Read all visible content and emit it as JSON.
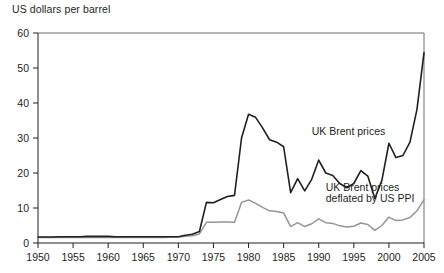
{
  "chart_data": {
    "type": "line",
    "title": "",
    "ylabel": "US dollars per barrel",
    "xlabel": "",
    "xlim": [
      1950,
      2005
    ],
    "ylim": [
      0,
      60
    ],
    "grid": false,
    "legend_position": "inline-annotation",
    "x_ticks": [
      1950,
      1955,
      1960,
      1965,
      1970,
      1975,
      1980,
      1985,
      1990,
      1995,
      2000,
      2005
    ],
    "y_ticks": [
      0,
      10,
      20,
      30,
      40,
      50,
      60
    ],
    "x": [
      1950,
      1951,
      1952,
      1953,
      1954,
      1955,
      1956,
      1957,
      1958,
      1959,
      1960,
      1961,
      1962,
      1963,
      1964,
      1965,
      1966,
      1967,
      1968,
      1969,
      1970,
      1971,
      1972,
      1973,
      1974,
      1975,
      1976,
      1977,
      1978,
      1979,
      1980,
      1981,
      1982,
      1983,
      1984,
      1985,
      1986,
      1987,
      1988,
      1989,
      1990,
      1991,
      1992,
      1993,
      1994,
      1995,
      1996,
      1997,
      1998,
      1999,
      2000,
      2001,
      2002,
      2003,
      2004,
      2005
    ],
    "series": [
      {
        "name": "UK Brent prices",
        "color": "#231f20",
        "values": [
          1.7,
          1.7,
          1.7,
          1.8,
          1.8,
          1.8,
          1.8,
          1.9,
          1.9,
          1.9,
          1.9,
          1.8,
          1.8,
          1.8,
          1.8,
          1.8,
          1.8,
          1.8,
          1.8,
          1.8,
          1.8,
          2.2,
          2.5,
          3.3,
          11.6,
          11.5,
          12.4,
          13.3,
          13.6,
          30.0,
          36.8,
          35.9,
          32.9,
          29.5,
          28.8,
          27.5,
          14.4,
          18.4,
          14.9,
          18.2,
          23.7,
          20.0,
          19.3,
          17.0,
          15.8,
          17.0,
          20.7,
          19.1,
          12.7,
          17.9,
          28.5,
          24.4,
          25.0,
          28.8,
          38.2,
          54.4
        ]
      },
      {
        "name": "UK Brent prices deflated by US PPI",
        "color": "#949599",
        "values": [
          1.6,
          1.6,
          1.6,
          1.6,
          1.6,
          1.6,
          1.6,
          1.6,
          1.6,
          1.6,
          1.6,
          1.6,
          1.6,
          1.6,
          1.6,
          1.6,
          1.6,
          1.6,
          1.6,
          1.7,
          1.7,
          1.9,
          2.1,
          2.6,
          5.9,
          5.9,
          6.0,
          6.0,
          5.9,
          11.6,
          12.3,
          11.3,
          10.2,
          9.2,
          9.0,
          8.6,
          4.7,
          5.8,
          4.7,
          5.5,
          6.9,
          5.8,
          5.6,
          4.9,
          4.6,
          4.8,
          5.7,
          5.3,
          3.6,
          5.0,
          7.4,
          6.4,
          6.6,
          7.3,
          9.2,
          12.4
        ]
      }
    ],
    "annotations": [
      {
        "text": "UK Brent prices",
        "x": 1989,
        "y": 31.0
      },
      {
        "text": "UK Brent prices",
        "x": 1991,
        "y": 14.8
      },
      {
        "text": "deflated by US PPI",
        "x": 1991,
        "y": 11.6
      }
    ]
  }
}
